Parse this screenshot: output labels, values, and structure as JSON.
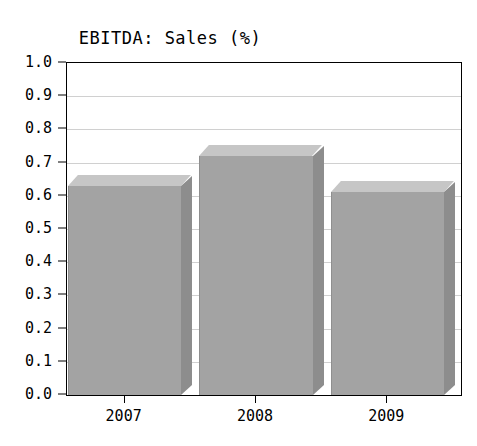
{
  "chart_data": {
    "type": "bar",
    "title": "EBITDA: Sales (%)",
    "xlabel": "",
    "ylabel": "",
    "categories": [
      "2007",
      "2008",
      "2009"
    ],
    "values": [
      0.63,
      0.72,
      0.61
    ],
    "series": [
      {
        "name": "EBITDA: Sales (%)",
        "values": [
          0.63,
          0.72,
          0.61
        ]
      }
    ],
    "ylim": [
      0.0,
      1.0
    ],
    "ytick_labels": [
      "1.0",
      "0.9",
      "0.8",
      "0.7",
      "0.6",
      "0.5",
      "0.4",
      "0.3",
      "0.2",
      "0.1",
      "0.0"
    ],
    "ytick_values": [
      1.0,
      0.9,
      0.8,
      0.7,
      0.6,
      0.5,
      0.4,
      0.3,
      0.2,
      0.1,
      0.0
    ],
    "grid": true,
    "legend": "none",
    "style": "3d-bar",
    "colors": {
      "bar_front": "#a3a3a3",
      "bar_top": "#c6c6c6",
      "bar_side": "#8d8d8d",
      "gridline": "#d0d0d0",
      "axis": "#000000",
      "plot_background": "#ffffff",
      "text": "#000000"
    }
  },
  "axes": {
    "y_ticks": [
      {
        "label": "1.0"
      },
      {
        "label": "0.9"
      },
      {
        "label": "0.8"
      },
      {
        "label": "0.7"
      },
      {
        "label": "0.6"
      },
      {
        "label": "0.5"
      },
      {
        "label": "0.4"
      },
      {
        "label": "0.3"
      },
      {
        "label": "0.2"
      },
      {
        "label": "0.1"
      },
      {
        "label": "0.0"
      }
    ],
    "x_ticks": [
      {
        "label": "2007"
      },
      {
        "label": "2008"
      },
      {
        "label": "2009"
      }
    ]
  }
}
